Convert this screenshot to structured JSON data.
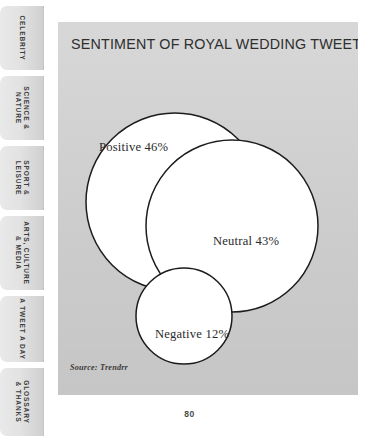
{
  "page": {
    "number": "80",
    "background_color": "#d2d2d2"
  },
  "chart_title": "SENTIMENT OF ROYAL WEDDING TWEETS",
  "source_note": "Source: Trendrr",
  "sidebar": {
    "tabs": [
      {
        "label": "CELEBRITY"
      },
      {
        "label": "SCIENCE &\nNATURE"
      },
      {
        "label": "SPORT &\nLEISURE"
      },
      {
        "label": "ARTS, CULTURE\n& MEDIA"
      },
      {
        "label": "A TWEET A DAY"
      },
      {
        "label": "GLOSSARY\n& THANKS"
      }
    ]
  },
  "chart_data": {
    "type": "pie",
    "title": "SENTIMENT OF ROYAL WEDDING TWEETS",
    "subtitle": "",
    "xlabel": "",
    "ylabel": "",
    "categories": [
      "Positive",
      "Neutral",
      "Negative"
    ],
    "values": [
      46,
      43,
      12
    ],
    "labels": [
      "Positive 46%",
      "Neutral 43%",
      "Negative 12%"
    ],
    "units": "percent",
    "legend": "none",
    "grid": false,
    "annotations": [
      "Source: Trendrr"
    ],
    "series": [
      {
        "name": "Sentiment share",
        "values": [
          46,
          43,
          12
        ]
      }
    ],
    "render": "proportional overlapping circles (area-scaled bubbles)",
    "bubble_fill": "#ffffff",
    "bubble_stroke": "#1c1c1c"
  }
}
